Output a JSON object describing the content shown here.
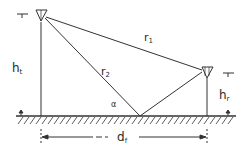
{
  "diagram": {
    "title": "",
    "labels": {
      "direct_path": "r",
      "direct_path_sub": "1",
      "reflected_path": "r",
      "reflected_path_sub": "2",
      "tx_height": "h",
      "tx_height_sub": "t",
      "rx_height": "h",
      "rx_height_sub": "r",
      "distance": "d",
      "distance_sub": "f",
      "grazing_angle": "α"
    },
    "elements": {
      "transmitter": "inverted-triangle antenna on mast (left)",
      "receiver": "inverted-triangle antenna on mast (right)",
      "ground": "hatched ground plane",
      "reflection_point": "point of specular reflection on ground"
    },
    "colors": {
      "stroke": "#333333",
      "background": "#ffffff"
    }
  }
}
